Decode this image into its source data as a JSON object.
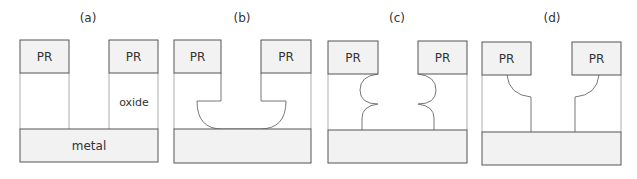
{
  "diagram": {
    "type": "process-cross-sections",
    "colors": {
      "fill": "#f2f2f2",
      "stroke": "#555555",
      "oxide_stroke": "#999999",
      "text": "#333333"
    },
    "panels": [
      {
        "label": "(a)",
        "pr_left": "PR",
        "pr_right": "PR",
        "oxide_label": "oxide",
        "metal_label": "metal",
        "profile": "vertical"
      },
      {
        "label": "(b)",
        "pr_left": "PR",
        "pr_right": "PR",
        "profile": "vertical-then-isotropic-bowl"
      },
      {
        "label": "(c)",
        "pr_left": "PR",
        "pr_right": "PR",
        "profile": "double-isotropic-scallop"
      },
      {
        "label": "(d)",
        "pr_left": "PR",
        "pr_right": "PR",
        "profile": "isotropic-then-vertical"
      }
    ]
  }
}
